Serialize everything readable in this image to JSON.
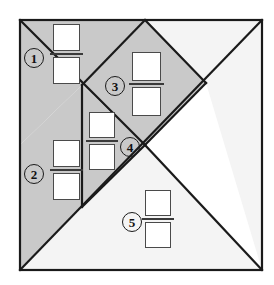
{
  "figure": {
    "type": "geometric-dissection-diagram",
    "frame": {
      "x": 20,
      "y": 20,
      "width": 242,
      "height": 250
    },
    "colors": {
      "shaded_fill": "#c9c9c9",
      "light_fill": "#f4f4f4",
      "stroke": "#1a1a1a",
      "square_fill": "#ffffff",
      "square_stroke": "#4a4a4a",
      "page_background": "#ffffff"
    },
    "pieces": [
      {
        "id": "piece-1",
        "label": "1",
        "fill": "shaded",
        "shape": "triangle",
        "points": "20,20 145,20 82,85 20,145"
      },
      {
        "id": "piece-2",
        "label": "2",
        "fill": "shaded",
        "shape": "triangle",
        "points": "20,145 82,85 82,207 20,270"
      },
      {
        "id": "piece-3",
        "label": "3",
        "fill": "shaded",
        "shape": "rhombus",
        "points": "145,20 206,83 145,145 82,85"
      },
      {
        "id": "piece-4",
        "label": "4",
        "fill": "shaded",
        "shape": "triangle",
        "points": "82,85 145,145 82,207"
      },
      {
        "id": "piece-5",
        "label": "5",
        "fill": "light",
        "shape": "triangle",
        "points": "82,207 145,145 262,270 20,270"
      },
      {
        "id": "piece-6",
        "label": "",
        "fill": "light",
        "shape": "triangle",
        "points": "145,20 262,20 262,270 206,83"
      }
    ],
    "lines": [
      {
        "id": "edge-diag-main",
        "from": [
          20,
          270
        ],
        "to": [
          262,
          20
        ]
      },
      {
        "id": "edge-diag-left",
        "from": [
          20,
          20
        ],
        "to": [
          145,
          145
        ]
      },
      {
        "id": "edge-vertical-mid",
        "from": [
          82,
          85
        ],
        "to": [
          82,
          207
        ]
      },
      {
        "id": "edge-rhombus-right",
        "from": [
          145,
          20
        ],
        "to": [
          206,
          83
        ]
      },
      {
        "id": "edge-rhombus-left",
        "from": [
          145,
          20
        ],
        "to": [
          82,
          85
        ]
      },
      {
        "id": "edge-rhombus-lower",
        "from": [
          206,
          83
        ],
        "to": [
          145,
          145
        ]
      },
      {
        "id": "edge-lower-diag",
        "from": [
          145,
          145
        ],
        "to": [
          262,
          270
        ]
      },
      {
        "id": "edge-piece4-hyp",
        "from": [
          82,
          207
        ],
        "to": [
          145,
          145
        ]
      }
    ],
    "markers": [
      {
        "id": "marker-1",
        "label": "1",
        "x": 24,
        "y": 48
      },
      {
        "id": "marker-2",
        "label": "2",
        "x": 24,
        "y": 164
      },
      {
        "id": "marker-3",
        "label": "3",
        "x": 105,
        "y": 76
      },
      {
        "id": "marker-4",
        "label": "4",
        "x": 120,
        "y": 137
      },
      {
        "id": "marker-5",
        "label": "5",
        "x": 122,
        "y": 212
      },
      {
        "id": "marker-label-piece-1",
        "label": "1"
      },
      {
        "id": "marker-label-piece-2",
        "label": "2"
      },
      {
        "id": "marker-label-piece-3",
        "label": "3"
      },
      {
        "id": "marker-label-piece-4",
        "label": "4"
      },
      {
        "id": "marker-label-piece-5",
        "label": "5"
      }
    ],
    "square_pairs": [
      {
        "id": "square-pair-1",
        "for_marker": "1",
        "x": 50,
        "y": 24,
        "size": 27
      },
      {
        "id": "square-pair-2",
        "for_marker": "2",
        "x": 50,
        "y": 140,
        "size": 27
      },
      {
        "id": "square-pair-3",
        "for_marker": "3",
        "x": 129,
        "y": 52,
        "size": 29
      },
      {
        "id": "square-pair-4",
        "for_marker": "4",
        "x": 86,
        "y": 112,
        "size": 26
      },
      {
        "id": "square-pair-5",
        "for_marker": "5",
        "x": 142,
        "y": 190,
        "size": 26
      }
    ]
  }
}
